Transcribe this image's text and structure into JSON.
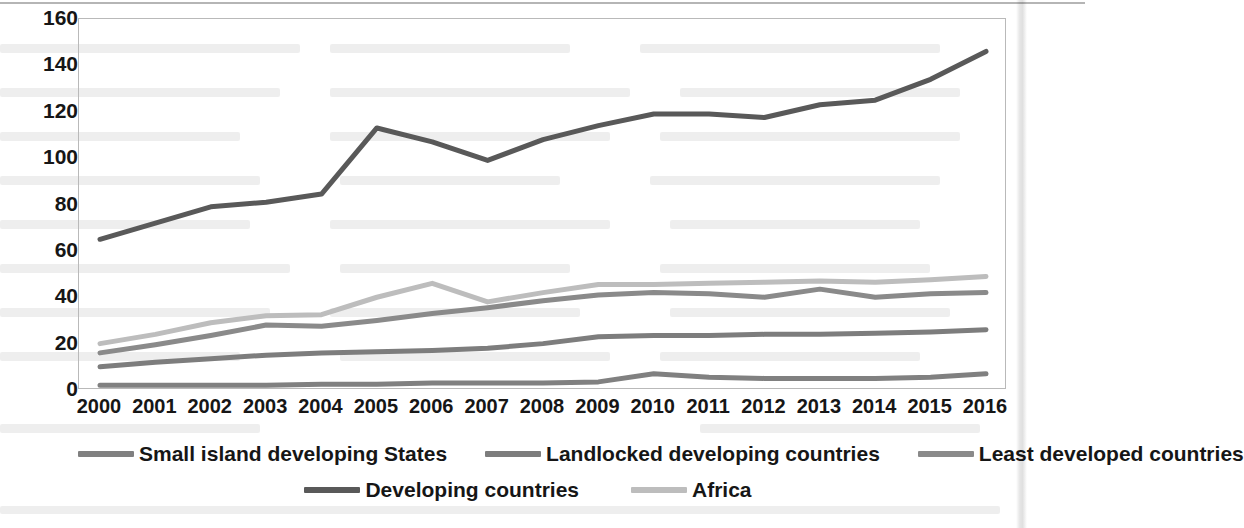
{
  "chart_data": {
    "type": "line",
    "title": "",
    "xlabel": "",
    "ylabel": "",
    "x": [
      2000,
      2001,
      2002,
      2003,
      2004,
      2005,
      2006,
      2007,
      2008,
      2009,
      2010,
      2011,
      2012,
      2013,
      2014,
      2015,
      2016
    ],
    "xtick_labels": [
      "2000",
      "2001",
      "2002",
      "2003",
      "2004",
      "2005",
      "2006",
      "2007",
      "2008",
      "2009",
      "2010",
      "2011",
      "2012",
      "2013",
      "2014",
      "2015",
      "2016"
    ],
    "ytick_labels": [
      "0",
      "20",
      "40",
      "60",
      "80",
      "100",
      "120",
      "140",
      "160"
    ],
    "yticks": [
      0,
      20,
      40,
      60,
      80,
      100,
      120,
      140,
      160
    ],
    "ylim": [
      0,
      160
    ],
    "xlim": [
      2000,
      2016
    ],
    "grid": false,
    "legend_position": "bottom",
    "series": [
      {
        "name": "Small island developing States",
        "color": "#808080",
        "values": [
          2,
          2,
          2,
          2,
          2.5,
          2.5,
          3,
          3,
          3,
          3.5,
          7,
          5.5,
          5,
          5,
          5,
          5.5,
          7
        ]
      },
      {
        "name": "Landlocked developing countries",
        "color": "#7d7d7d",
        "values": [
          10,
          12,
          13.5,
          15,
          16,
          16.5,
          17,
          18,
          20,
          23,
          23.5,
          23.5,
          24,
          24,
          24.5,
          25,
          26
        ]
      },
      {
        "name": "Least developed countries",
        "color": "#8a8a8a",
        "values": [
          16,
          19.5,
          23.5,
          28,
          27.5,
          30,
          33,
          35.5,
          38.5,
          41,
          42,
          41.5,
          40,
          43.5,
          40,
          41.5,
          42
        ]
      },
      {
        "name": "Developing countries",
        "color": "#595959",
        "values": [
          65,
          72,
          79,
          81,
          84.5,
          113,
          107,
          99,
          108,
          114,
          119,
          119,
          117.5,
          123,
          125,
          134,
          146
        ]
      },
      {
        "name": "Africa",
        "color": "#bdbdbd",
        "values": [
          20,
          24,
          29,
          32,
          32.5,
          40,
          46,
          38,
          42,
          45.5,
          45.5,
          46,
          46.5,
          47,
          46.5,
          47.5,
          49
        ]
      }
    ]
  },
  "legend": {
    "row_1": [
      {
        "label": "Small island developing States",
        "swatch_color": "#808080"
      },
      {
        "label": "Landlocked developing countries",
        "swatch_color": "#7d7d7d"
      },
      {
        "label": "Least developed countries",
        "swatch_color": "#8a8a8a"
      }
    ],
    "row_2": [
      {
        "label": "Developing countries",
        "swatch_color": "#595959"
      },
      {
        "label": "Africa",
        "swatch_color": "#bdbdbd"
      }
    ]
  }
}
